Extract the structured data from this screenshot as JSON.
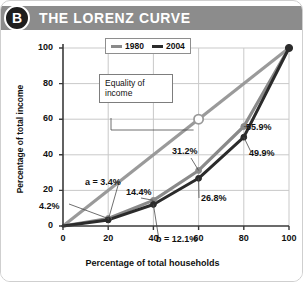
{
  "header": {
    "badge": "B",
    "title": "The Lorenz Curve"
  },
  "chart_data": {
    "type": "line",
    "title": "The Lorenz Curve",
    "xlabel": "Percentage of total households",
    "ylabel": "Percentage of total income",
    "xlim": [
      0,
      100
    ],
    "ylim": [
      0,
      100
    ],
    "xticks": [
      "0",
      "20",
      "40",
      "60",
      "80",
      "100"
    ],
    "yticks": [
      "0",
      "20",
      "40",
      "60",
      "80",
      "100"
    ],
    "grid": true,
    "legend_position": "top-center",
    "x": [
      0,
      20,
      40,
      60,
      80,
      100
    ],
    "series": [
      {
        "name": "1980",
        "color": "#8a8a8a",
        "values": [
          0,
          4.2,
          14.4,
          31.2,
          55.9,
          100
        ]
      },
      {
        "name": "2004",
        "color": "#2b2b2b",
        "values": [
          0,
          3.4,
          12.1,
          26.8,
          49.9,
          100
        ]
      },
      {
        "name": "Equality of income",
        "color": "#9a9a9a",
        "values": [
          0,
          20,
          40,
          60,
          80,
          100
        ]
      }
    ],
    "annotations": [
      {
        "label": "a = 3.4%",
        "x": 20,
        "y": 3.4
      },
      {
        "label": "4.2%",
        "x": 20,
        "y": 4.2
      },
      {
        "label": "14.4%",
        "x": 40,
        "y": 14.4
      },
      {
        "label": "b = 12.1%",
        "x": 40,
        "y": 12.1
      },
      {
        "label": "31.2%",
        "x": 60,
        "y": 31.2
      },
      {
        "label": "26.8%",
        "x": 60,
        "y": 26.8
      },
      {
        "label": "55.9%",
        "x": 80,
        "y": 55.9
      },
      {
        "label": "49.9%",
        "x": 80,
        "y": 49.9
      },
      {
        "label": "Equality of\nincome",
        "x": 60,
        "y": 60
      }
    ],
    "callout": {
      "line1": "Equality of",
      "line2": "income"
    }
  },
  "annotation_labels": {
    "a": "a = 3.4%",
    "v4_2": "4.2%",
    "v14_4": "14.4%",
    "b": "b = 12.1%",
    "v31_2": "31.2%",
    "v26_8": "26.8%",
    "v55_9": "55.9%",
    "v49_9": "49.9%"
  },
  "colors": {
    "header_bar": "#8c8c8c",
    "badge": "#1d1d1d",
    "series_1980": "#8a8a8a",
    "series_2004": "#2b2b2b",
    "equality_line": "#9a9a9a",
    "grid": "#c9c9c9",
    "axis": "#3a3a3a"
  }
}
